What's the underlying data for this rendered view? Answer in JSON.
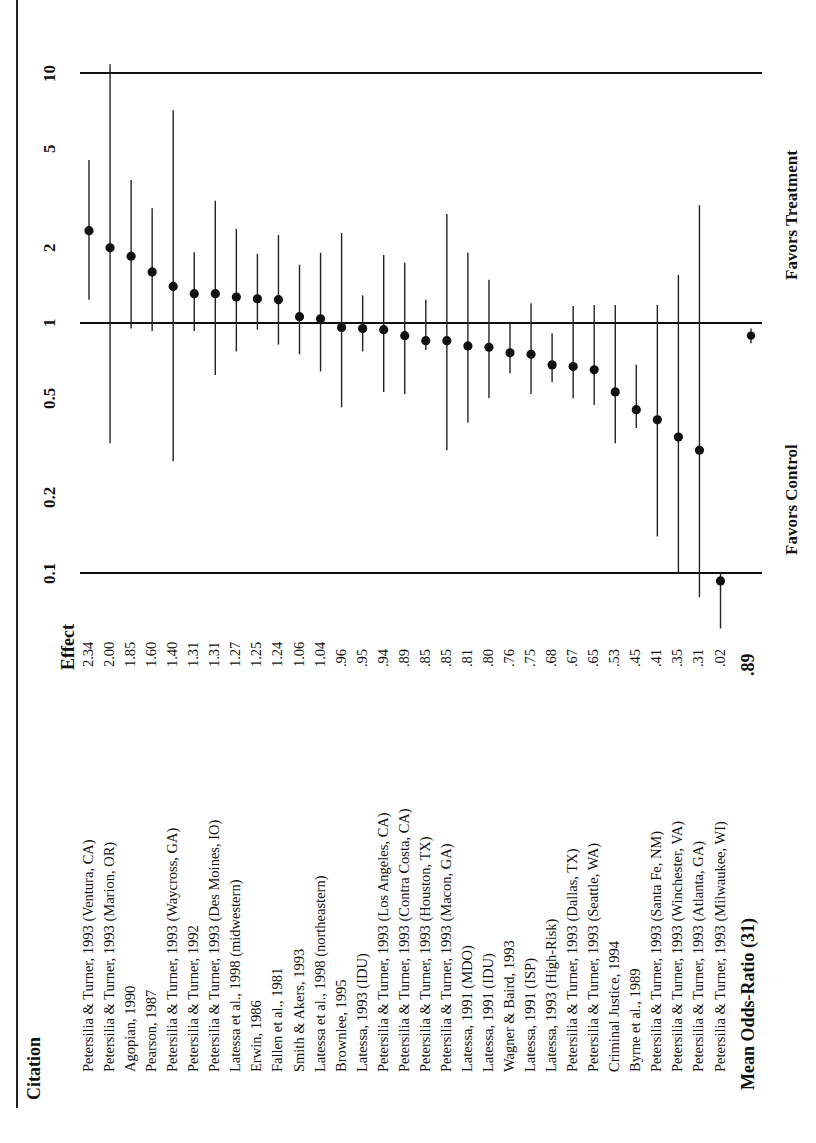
{
  "chart_data": {
    "type": "forest",
    "orientation": "rotated-90-ccw",
    "title": "",
    "xlabel": "Odds-Ratio (log scale)",
    "scale": "log",
    "axis_ticks": [
      "0.1",
      "0.2",
      "0.5",
      "1",
      "2",
      "5",
      "10"
    ],
    "axis_range": [
      0.1,
      10
    ],
    "reference_lines": [
      0.1,
      1,
      10
    ],
    "direction_labels": {
      "below_one": "Favors Control",
      "above_one": "Favors Treatment"
    },
    "headers": {
      "citation": "Citation",
      "effect": "Effect"
    },
    "studies": [
      {
        "citation": "Petersilia & Turner, 1993 (Ventura, CA)",
        "effect": "2.34",
        "or": 2.34,
        "ci": [
          1.24,
          4.49
        ]
      },
      {
        "citation": "Petersilia & Turner, 1993 (Marion, OR)",
        "effect": "2.00",
        "or": 2.0,
        "ci": [
          0.33,
          10.85
        ]
      },
      {
        "citation": "Agopian, 1990",
        "effect": "1.85",
        "or": 1.85,
        "ci": [
          0.95,
          3.73
        ]
      },
      {
        "citation": "Pearson, 1987",
        "effect": "1.60",
        "or": 1.6,
        "ci": [
          0.93,
          2.88
        ]
      },
      {
        "citation": "Petersilia & Turner, 1993 (Waycross, GA)",
        "effect": "1.40",
        "or": 1.4,
        "ci": [
          0.28,
          7.1
        ]
      },
      {
        "citation": "Petersilia & Turner, 1992",
        "effect": "1.31",
        "or": 1.31,
        "ci": [
          0.93,
          1.92
        ]
      },
      {
        "citation": "Petersilia & Turner, 1993 (Des Moines, IO)",
        "effect": "1.31",
        "or": 1.31,
        "ci": [
          0.62,
          3.08
        ]
      },
      {
        "citation": "Latessa et al., 1998 (midwestern)",
        "effect": "1.27",
        "or": 1.27,
        "ci": [
          0.77,
          2.38
        ]
      },
      {
        "citation": "Erwin, 1986",
        "effect": "1.25",
        "or": 1.25,
        "ci": [
          0.94,
          1.89
        ]
      },
      {
        "citation": "Fallen et al., 1981",
        "effect": "1.24",
        "or": 1.24,
        "ci": [
          0.82,
          2.25
        ]
      },
      {
        "citation": "Smith & Akers, 1993",
        "effect": "1.06",
        "or": 1.06,
        "ci": [
          0.75,
          1.71
        ]
      },
      {
        "citation": "Latessa et al., 1998 (northeastern)",
        "effect": "1.04",
        "or": 1.04,
        "ci": [
          0.64,
          1.91
        ]
      },
      {
        "citation": "Brownlee, 1995",
        "effect": ".96",
        "or": 0.96,
        "ci": [
          0.46,
          2.29
        ]
      },
      {
        "citation": "Latessa, 1993 (IDU)",
        "effect": ".95",
        "or": 0.95,
        "ci": [
          0.77,
          1.29
        ]
      },
      {
        "citation": "Petersilia & Turner, 1993 (Los Angeles, CA)",
        "effect": ".94",
        "or": 0.94,
        "ci": [
          0.53,
          1.87
        ]
      },
      {
        "citation": "Petersilia & Turner, 1993 (Contra Costa, CA)",
        "effect": ".89",
        "or": 0.89,
        "ci": [
          0.52,
          1.74
        ]
      },
      {
        "citation": "Petersilia & Turner, 1993 (Houston, TX)",
        "effect": ".85",
        "or": 0.85,
        "ci": [
          0.78,
          1.24
        ]
      },
      {
        "citation": "Petersilia & Turner, 1993 (Macon, GA)",
        "effect": ".85",
        "or": 0.85,
        "ci": [
          0.31,
          2.73
        ]
      },
      {
        "citation": "Latessa, 1991 (MDO)",
        "effect": ".81",
        "or": 0.81,
        "ci": [
          0.4,
          1.91
        ]
      },
      {
        "citation": "Latessa, 1991 (IDU)",
        "effect": ".80",
        "or": 0.8,
        "ci": [
          0.5,
          1.49
        ]
      },
      {
        "citation": "Wagner & Baird, 1993",
        "effect": ".76",
        "or": 0.76,
        "ci": [
          0.63,
          1.0
        ]
      },
      {
        "citation": "Latessa, 1991 (ISP)",
        "effect": ".75",
        "or": 0.75,
        "ci": [
          0.52,
          1.2
        ]
      },
      {
        "citation": "Latessa, 1993 (High-Risk)",
        "effect": ".68",
        "or": 0.68,
        "ci": [
          0.58,
          0.91
        ]
      },
      {
        "citation": "Petersilia & Turner, 1993 (Dallas, TX)",
        "effect": ".67",
        "or": 0.67,
        "ci": [
          0.5,
          1.17
        ]
      },
      {
        "citation": "Petersilia & Turner, 1993 (Seattle, WA)",
        "effect": ".65",
        "or": 0.65,
        "ci": [
          0.47,
          1.18
        ]
      },
      {
        "citation": "Criminal Justice, 1994",
        "effect": ".53",
        "or": 0.53,
        "ci": [
          0.33,
          1.18
        ]
      },
      {
        "citation": "Byrne et al., 1989",
        "effect": ".45",
        "or": 0.45,
        "ci": [
          0.38,
          0.68
        ]
      },
      {
        "citation": "Petersilia & Turner, 1993 (Santa Fe, NM)",
        "effect": ".41",
        "or": 0.41,
        "ci": [
          0.14,
          1.18
        ]
      },
      {
        "citation": "Petersilia & Turner, 1993 (Winchester, VA)",
        "effect": ".35",
        "or": 0.35,
        "ci": [
          0.1,
          1.56
        ]
      },
      {
        "citation": "Petersilia & Turner, 1993 (Atlanta, GA)",
        "effect": ".31",
        "or": 0.31,
        "ci": [
          0.08,
          2.96
        ]
      },
      {
        "citation": "Petersilia & Turner, 1993 (Milwaukee, WI)",
        "effect": ".02",
        "or": 0.093,
        "ci": [
          0.06,
          0.1
        ]
      }
    ],
    "summary": {
      "label": "Mean Odds-Ratio (31)",
      "effect": ".89",
      "or": 0.89,
      "ci": [
        0.83,
        0.95
      ]
    }
  },
  "ui": {
    "header_citation": "Citation",
    "header_effect": "Effect",
    "mean_label": "Mean Odds-Ratio (31)",
    "mean_effect": ".89",
    "favors_control": "Favors Control",
    "favors_treatment": "Favors Treatment"
  }
}
